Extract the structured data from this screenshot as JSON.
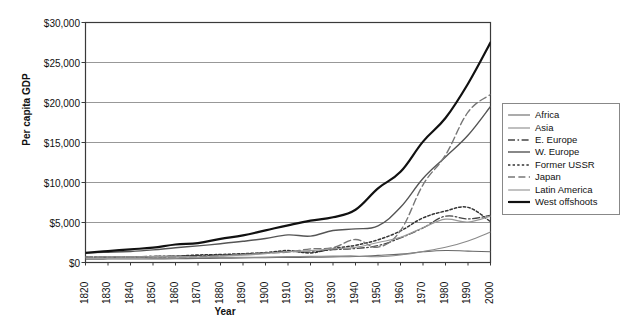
{
  "chart_data": {
    "type": "line",
    "title": "",
    "xlabel": "Year",
    "ylabel": "Per capita GDP",
    "xlim": [
      1820,
      2000
    ],
    "ylim": [
      0,
      30000
    ],
    "grid": true,
    "legend_position": "right",
    "x": [
      1820,
      1830,
      1840,
      1850,
      1860,
      1870,
      1880,
      1890,
      1900,
      1910,
      1920,
      1930,
      1940,
      1950,
      1960,
      1970,
      1980,
      1990,
      2000
    ],
    "xtick_labels": [
      "1820",
      "1830",
      "1840",
      "1850",
      "1860",
      "1870",
      "1880",
      "1890",
      "1900",
      "1910",
      "1920",
      "1930",
      "1940",
      "1950",
      "1960",
      "1970",
      "1980",
      "1990",
      "2000"
    ],
    "ytick_labels": [
      "$0",
      "$5,000",
      "$10,000",
      "$15,000",
      "$20,000",
      "$25,000",
      "$30,000"
    ],
    "ytick_values": [
      0,
      5000,
      10000,
      15000,
      20000,
      25000,
      30000
    ],
    "series": [
      {
        "name": "Africa",
        "color": "#666666",
        "width": 1.1,
        "dash": "none",
        "values": [
          420,
          430,
          440,
          450,
          460,
          500,
          530,
          570,
          600,
          640,
          650,
          700,
          750,
          890,
          1050,
          1340,
          1500,
          1420,
          1350
        ]
      },
      {
        "name": "Asia",
        "color": "#8a8a8a",
        "width": 1.1,
        "dash": "none",
        "values": [
          580,
          580,
          580,
          580,
          590,
          600,
          620,
          650,
          680,
          730,
          760,
          800,
          820,
          720,
          950,
          1380,
          1900,
          2700,
          3800
        ]
      },
      {
        "name": "E. Europe",
        "color": "#444444",
        "width": 1.3,
        "dash": "dash-dot",
        "values": [
          680,
          700,
          720,
          760,
          820,
          870,
          950,
          1050,
          1200,
          1380,
          1300,
          1600,
          1750,
          2110,
          3070,
          4320,
          5790,
          5450,
          5900
        ]
      },
      {
        "name": "W. Europe",
        "color": "#555555",
        "width": 1.4,
        "dash": "none",
        "values": [
          1200,
          1280,
          1380,
          1580,
          1850,
          2080,
          2350,
          2650,
          3000,
          3450,
          3300,
          4000,
          4200,
          4580,
          6900,
          10500,
          13200,
          15900,
          19500
        ]
      },
      {
        "name": "Former USSR",
        "color": "#333333",
        "width": 1.5,
        "dash": "dot",
        "values": [
          690,
          700,
          710,
          740,
          790,
          940,
          1000,
          1100,
          1240,
          1490,
          1200,
          1750,
          2150,
          2840,
          3950,
          5570,
          6430,
          6890,
          5100
        ]
      },
      {
        "name": "Japan",
        "color": "#777777",
        "width": 1.4,
        "dash": "dash-long",
        "values": [
          670,
          680,
          690,
          700,
          720,
          740,
          860,
          1010,
          1180,
          1300,
          1700,
          1850,
          2870,
          1920,
          3990,
          9710,
          13430,
          18790,
          21000
        ]
      },
      {
        "name": "Latin America",
        "color": "#999999",
        "width": 1.2,
        "dash": "none",
        "values": [
          690,
          700,
          710,
          740,
          800,
          680,
          800,
          930,
          1110,
          1350,
          1490,
          1700,
          1900,
          2500,
          3140,
          4350,
          5410,
          5060,
          5800
        ]
      },
      {
        "name": "West offshoots",
        "color": "#111111",
        "width": 2.2,
        "dash": "none",
        "values": [
          1200,
          1430,
          1650,
          1850,
          2250,
          2430,
          2950,
          3400,
          4020,
          4650,
          5230,
          5650,
          6600,
          9270,
          11330,
          15110,
          18060,
          22350,
          27500
        ]
      }
    ]
  }
}
